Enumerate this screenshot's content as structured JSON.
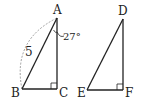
{
  "figure": {
    "triangle_abc": {
      "vertices": {
        "A": "A",
        "B": "B",
        "C": "C"
      },
      "side_ab_label": "5",
      "angle_a_label": "27°",
      "right_angle_at": "C"
    },
    "triangle_def": {
      "vertices": {
        "D": "D",
        "E": "E",
        "F": "F"
      },
      "right_angle_at": "F"
    }
  },
  "colors": {
    "stroke": "#222222",
    "dashed_arc": "#888888",
    "background": "#ffffff"
  }
}
